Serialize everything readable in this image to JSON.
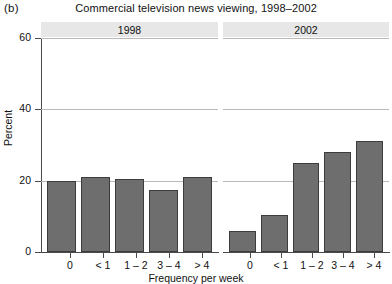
{
  "figure": {
    "panel_label": "(b)",
    "title": "Commercial television news viewing, 1998–2002"
  },
  "chart_data": {
    "type": "bar",
    "title": "Commercial television news viewing, 1998–2002",
    "xlabel": "Frequency per week",
    "ylabel": "Percent",
    "ylim": [
      0,
      60
    ],
    "yticks": [
      0,
      20,
      40,
      60
    ],
    "ytick_labels": [
      "0",
      "20",
      "40",
      "60"
    ],
    "grid": true,
    "legend": "none",
    "facet_variable": "year",
    "categories": [
      "0",
      "< 1",
      "1 – 2",
      "3 – 4",
      "> 4"
    ],
    "panels": [
      {
        "facet_label": "1998",
        "values": [
          20,
          21,
          20.5,
          17.5,
          21
        ]
      },
      {
        "facet_label": "2002",
        "values": [
          6,
          10.3,
          25,
          28,
          31
        ]
      }
    ],
    "series": [
      {
        "name": "1998",
        "values": [
          20,
          21,
          20.5,
          17.5,
          21
        ]
      },
      {
        "name": "2002",
        "values": [
          6,
          10.3,
          25,
          28,
          31
        ]
      }
    ],
    "colors": {
      "bar_fill": "#6e6e6e",
      "bar_stroke": "#3c3c3c",
      "strip_background": "#e7e7e7",
      "gridline": "#b9b9b9",
      "axis": "#4a4a4a",
      "background": "#ffffff"
    }
  }
}
